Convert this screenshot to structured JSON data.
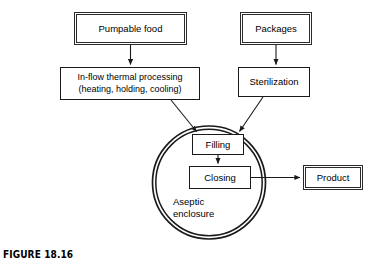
{
  "figure": {
    "caption": "FIGURE 18.16",
    "background_color": "#ffffff",
    "line_color": "#1a1a1a"
  },
  "diagram": {
    "type": "process-flow",
    "nodes": [
      {
        "id": "pumpable_food",
        "label": "Pumpable food",
        "style": "double"
      },
      {
        "id": "packages",
        "label": "Packages",
        "style": "double"
      },
      {
        "id": "thermal_processing",
        "label": "In-flow thermal processing\n(heating, holding, cooling)",
        "style": "plain"
      },
      {
        "id": "sterilization",
        "label": "Sterilization",
        "style": "plain"
      },
      {
        "id": "filling",
        "label": "Filling",
        "style": "plain"
      },
      {
        "id": "closing",
        "label": "Closing",
        "style": "plain"
      },
      {
        "id": "product",
        "label": "Product",
        "style": "double"
      }
    ],
    "enclosure": {
      "id": "aseptic_enclosure",
      "label": "Aseptic\nenclosure",
      "shape": "double-circle",
      "contains": [
        "filling",
        "closing"
      ]
    },
    "edges": [
      {
        "from": "pumpable_food",
        "to": "thermal_processing",
        "arrow": true
      },
      {
        "from": "packages",
        "to": "sterilization",
        "arrow": true
      },
      {
        "from": "thermal_processing",
        "to": "filling",
        "arrow": true
      },
      {
        "from": "sterilization",
        "to": "filling",
        "arrow": true
      },
      {
        "from": "filling",
        "to": "closing",
        "arrow": true
      },
      {
        "from": "closing",
        "to": "product",
        "arrow": true
      }
    ]
  }
}
